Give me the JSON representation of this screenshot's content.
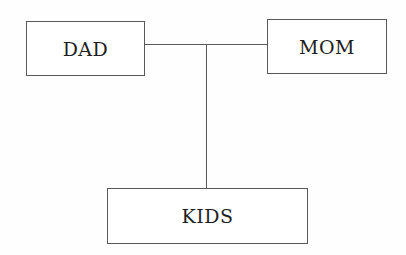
{
  "diagram": {
    "type": "family-tree",
    "nodes": {
      "dad": {
        "label": "DAD"
      },
      "mom": {
        "label": "MOM"
      },
      "kids": {
        "label": "KIDS"
      }
    },
    "edges": [
      {
        "from": "dad",
        "to": "mom",
        "kind": "partner-line"
      },
      {
        "from": "partner-line",
        "to": "kids",
        "kind": "descent-line"
      }
    ]
  },
  "colors": {
    "stroke": "#5a5a5a",
    "text": "#1e1e1e",
    "background": "#fefefe"
  }
}
